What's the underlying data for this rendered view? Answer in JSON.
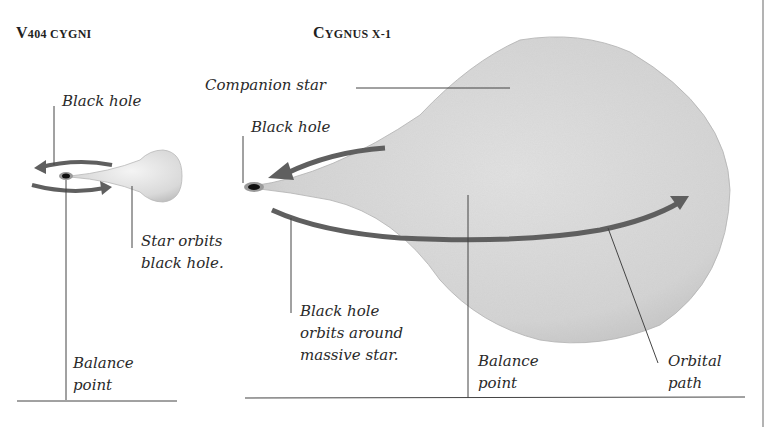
{
  "panels": {
    "left": {
      "title_first": "V",
      "title_rest": "404 CYGNI",
      "labels": {
        "black_hole": "Black hole",
        "star_orbits_line1": "Star orbits",
        "star_orbits_line2": "black hole.",
        "balance_line1": "Balance",
        "balance_line2": "point"
      }
    },
    "right": {
      "title_first": "C",
      "title_rest": "YGNUS X-1",
      "labels": {
        "companion_star": "Companion star",
        "black_hole": "Black hole",
        "bh_orbits_line1": "Black hole",
        "bh_orbits_line2": "orbits around",
        "bh_orbits_line3": "massive star.",
        "balance_line1": "Balance",
        "balance_line2": "point",
        "orbital_line1": "Orbital",
        "orbital_line2": "path"
      }
    }
  },
  "colors": {
    "arrow": "#5f5f5f",
    "star_fill": "#dcdcdc",
    "leader_line": "#444444",
    "black_hole": "#111111"
  }
}
